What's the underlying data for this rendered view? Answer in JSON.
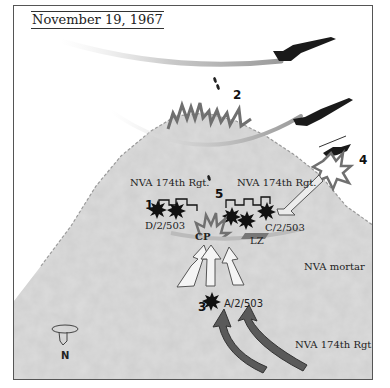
{
  "title": "November 19, 1967",
  "labels": {
    "nva_left": "NVA 174th Rgt.",
    "nva_right": "NVA 174th Rgt.",
    "nva_bottom": "NVA 174th Rgt.",
    "d_company": "D/2/503",
    "c_company": "C/2/503",
    "a_company": "A/2/503",
    "cp": "CP",
    "lz": "LZ",
    "mortar": "NVA mortar",
    "north": "N"
  },
  "markers": {
    "m1": "1",
    "m2": "2",
    "m3": "3",
    "m4": "4",
    "m5": "5"
  },
  "colors": {
    "hill": "#d9d9d9",
    "hill_shadow": "#b8b8b8",
    "explosion": "#7a7a7a",
    "enemy_arrow": "#5a5a5a",
    "friendly_arrow": "#f2f2f2",
    "aircraft": "#1a1a1a"
  }
}
